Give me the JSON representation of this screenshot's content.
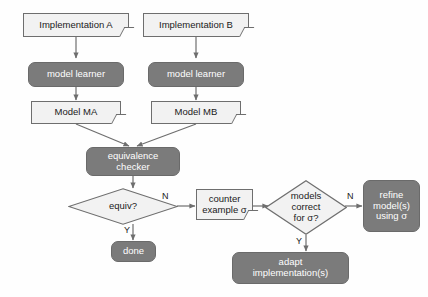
{
  "diagram": {
    "colors": {
      "background": "#fefefe",
      "light_fill": "#f2f2f2",
      "light_border": "#6e6e6e",
      "dark_fill": "#7b7b7b",
      "dark_border": "#6a6a6a",
      "dark_text": "#ffffff",
      "light_text": "#1a1a1a",
      "arrow": "#6e6e6e"
    },
    "nodes": {
      "implementation_a": {
        "label": "Implementation A",
        "shape": "document"
      },
      "implementation_b": {
        "label": "Implementation B",
        "shape": "document"
      },
      "model_learner_a": {
        "label": "model learner",
        "shape": "rounded-process"
      },
      "model_learner_b": {
        "label": "model learner",
        "shape": "rounded-process"
      },
      "model_ma": {
        "label": "Model MA",
        "shape": "document"
      },
      "model_mb": {
        "label": "Model MB",
        "shape": "document"
      },
      "equivalence_checker": {
        "line1": "equivalence",
        "line2": "checker",
        "shape": "rounded-process"
      },
      "equiv_decision": {
        "label": "equiv?",
        "shape": "diamond"
      },
      "done": {
        "label": "done",
        "shape": "rounded-process"
      },
      "counter_example": {
        "line1": "counter",
        "line2": "example σ",
        "shape": "document"
      },
      "models_correct_decision": {
        "line1": "models",
        "line2": "correct",
        "line3": "for σ?",
        "shape": "diamond"
      },
      "refine_models": {
        "line1": "refine",
        "line2": "model(s)",
        "line3": "using σ",
        "shape": "rounded-process"
      },
      "adapt_implementations": {
        "line1": "adapt",
        "line2": "implementation(s)",
        "shape": "rounded-process"
      }
    },
    "edge_labels": {
      "equiv_no": "N",
      "equiv_yes": "Y",
      "models_correct_no": "N",
      "models_correct_yes": "Y"
    }
  }
}
